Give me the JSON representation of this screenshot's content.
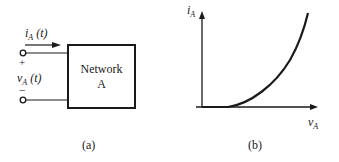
{
  "panel_a": {
    "current_label": {
      "symbol": "i",
      "subscript": "A",
      "arg": "(t)"
    },
    "voltage_label": {
      "symbol": "v",
      "subscript": "A",
      "arg": "(t)"
    },
    "plus_sign": "+",
    "minus_sign": "−",
    "box_line1": "Network",
    "box_line2": "A",
    "caption": "(a)"
  },
  "panel_b": {
    "y_axis_label": {
      "symbol": "i",
      "subscript": "A"
    },
    "x_axis_label": {
      "symbol": "v",
      "subscript": "A"
    },
    "caption": "(b)"
  },
  "colors": {
    "ink": "#1a1a1a",
    "background": "#ffffff"
  }
}
